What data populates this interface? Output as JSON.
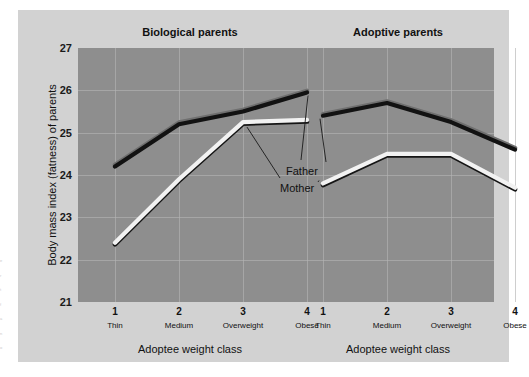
{
  "figure": {
    "y_axis_title": "Body mass index (fatness) of parents",
    "y_ticks": [
      "27",
      "26",
      "25",
      "24",
      "23",
      "22",
      "21"
    ],
    "annotations": [
      {
        "label": "Father"
      },
      {
        "label": "Mother"
      }
    ],
    "panels": [
      {
        "title": "Biological parents",
        "x_axis_title": "Adoptee weight class",
        "x_numbers": [
          "1",
          "2",
          "3",
          "4"
        ],
        "x_words": [
          "Thin",
          "Medium",
          "Overweight",
          "Obese"
        ]
      },
      {
        "title": "Adoptive parents",
        "x_axis_title": "Adoptee weight class",
        "x_numbers": [
          "1",
          "2",
          "3",
          "4"
        ],
        "x_words": [
          "Thin",
          "Medium",
          "Overweight",
          "Obese"
        ]
      }
    ]
  },
  "colors": {
    "page": "#ffffff",
    "figure_background": "#d2d2d2",
    "plot_background": "#8e8e8e",
    "gridline": "#b4b4b4",
    "father_line": "#111111",
    "mother_line": "#ffffff",
    "text": "#111111"
  },
  "margin_text": [
    "e",
    "r",
    "t",
    "f",
    "a",
    "n",
    "o"
  ],
  "chart_data": {
    "type": "line",
    "title": "",
    "subtitle": "",
    "xlabel": "Adoptee weight class",
    "ylabel": "Body mass index (fatness) of parents",
    "ylim": [
      21,
      27
    ],
    "y_ticks": [
      21,
      22,
      23,
      24,
      25,
      26,
      27
    ],
    "grid": true,
    "legend": "inline-annotations",
    "categories": [
      "Thin",
      "Medium",
      "Overweight",
      "Obese"
    ],
    "category_numbers": [
      1,
      2,
      3,
      4
    ],
    "panels": [
      {
        "name": "Biological parents",
        "series": [
          {
            "name": "Father",
            "color": "#111111",
            "values": [
              24.2,
              25.2,
              25.5,
              25.95
            ]
          },
          {
            "name": "Mother",
            "color": "#ffffff",
            "values": [
              22.4,
              23.9,
              25.25,
              25.3
            ]
          }
        ]
      },
      {
        "name": "Adoptive parents",
        "series": [
          {
            "name": "Father",
            "color": "#111111",
            "values": [
              25.4,
              25.7,
              25.25,
              24.6
            ]
          },
          {
            "name": "Mother",
            "color": "#ffffff",
            "values": [
              23.8,
              24.5,
              24.5,
              23.7
            ]
          }
        ]
      }
    ]
  }
}
